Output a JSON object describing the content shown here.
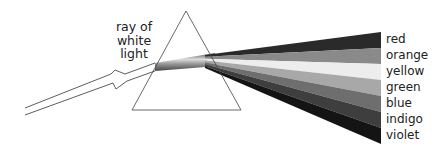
{
  "diagram": {
    "ray_label": [
      "ray of",
      "white",
      "light"
    ],
    "spectrum": [
      {
        "name": "red",
        "shade": "#2a2a2a"
      },
      {
        "name": "orange",
        "shade": "#8a8a8a"
      },
      {
        "name": "yellow",
        "shade": "#ededed"
      },
      {
        "name": "green",
        "shade": "#a8a8a8"
      },
      {
        "name": "blue",
        "shade": "#6e6e6e"
      },
      {
        "name": "indigo",
        "shade": "#3e3e3e"
      },
      {
        "name": "violet",
        "shade": "#141414"
      }
    ]
  }
}
